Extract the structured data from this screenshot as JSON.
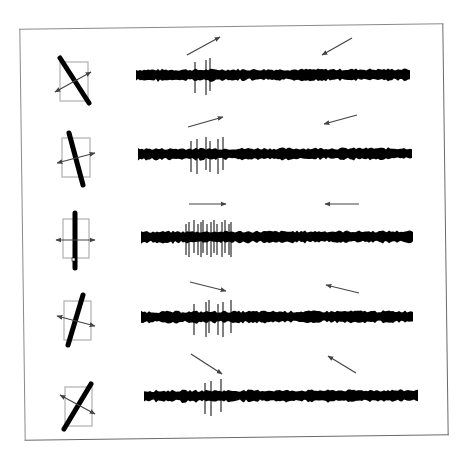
{
  "figure": {
    "title": "Orientation-selective neuron responses to moving bar stimuli",
    "frame_color": "#6a6a6a",
    "trace_color": "#000000",
    "arrow_color": "#444444",
    "receptive_field_color": "#b0b0b0"
  },
  "rows": [
    {
      "id": "row-1",
      "bar_angle_deg": -30,
      "stimulus": "bar tilted left (\\)",
      "forward_arrow": "up-right",
      "reverse_arrow": "down-left",
      "spikes": 3,
      "response": "weak"
    },
    {
      "id": "row-2",
      "bar_angle_deg": -18,
      "stimulus": "bar slightly tilted left",
      "forward_arrow": "right (slightly up)",
      "reverse_arrow": "left (slightly down)",
      "spikes": 6,
      "response": "moderate"
    },
    {
      "id": "row-3",
      "bar_angle_deg": 0,
      "stimulus": "vertical bar",
      "forward_arrow": "right",
      "reverse_arrow": "left",
      "spikes": 14,
      "response": "strong"
    },
    {
      "id": "row-4",
      "bar_angle_deg": 18,
      "stimulus": "bar slightly tilted right",
      "forward_arrow": "right (slightly down)",
      "reverse_arrow": "left (slightly up)",
      "spikes": 6,
      "response": "moderate"
    },
    {
      "id": "row-5",
      "bar_angle_deg": 35,
      "stimulus": "bar tilted right (/)",
      "forward_arrow": "down-right",
      "reverse_arrow": "up-left",
      "spikes": 3,
      "response": "weak"
    }
  ]
}
